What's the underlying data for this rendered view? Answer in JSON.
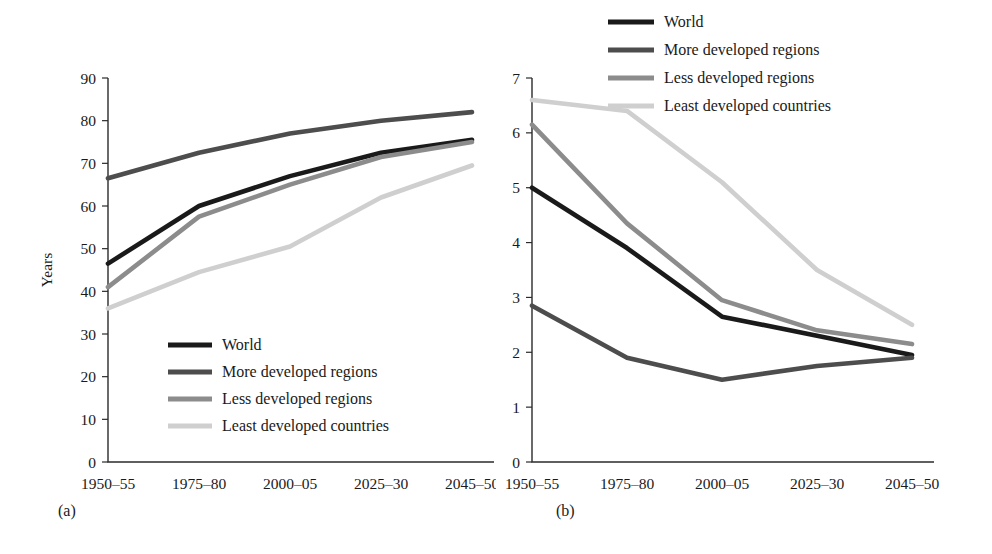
{
  "figure": {
    "background": "#ffffff",
    "panel_labels": {
      "a": "(a)",
      "b": "(b)"
    }
  },
  "palette": {
    "world": "#1a1a1a",
    "more_developed": "#4d4d4d",
    "less_developed": "#8c8c8c",
    "least_developed": "#cfcfcf",
    "axis": "#2b2b2b",
    "text": "#1a1a1a"
  },
  "chart_data": [
    {
      "id": "panel-a",
      "panel_label": "(a)",
      "type": "line",
      "title": "",
      "subtitle": "",
      "xlabel": "",
      "ylabel": "Years",
      "categories": [
        "1950–55",
        "1975–80",
        "2000–05",
        "2025–30",
        "2045–50"
      ],
      "ylim": [
        0,
        90
      ],
      "yticks": [
        0,
        10,
        20,
        30,
        40,
        50,
        60,
        70,
        80,
        90
      ],
      "ytick_labels": [
        "0",
        "10",
        "20",
        "30",
        "40",
        "50",
        "60",
        "70",
        "80",
        "90"
      ],
      "grid": false,
      "legend_position": "inside-bottom-left",
      "series": [
        {
          "name": "World",
          "color": "#1a1a1a",
          "values": [
            46.5,
            60.0,
            67.0,
            72.5,
            75.5
          ]
        },
        {
          "name": "More developed regions",
          "color": "#4d4d4d",
          "values": [
            66.5,
            72.5,
            77.0,
            80.0,
            82.0
          ]
        },
        {
          "name": "Less developed regions",
          "color": "#8c8c8c",
          "values": [
            41.0,
            57.5,
            65.0,
            71.5,
            75.0
          ]
        },
        {
          "name": "Least developed countries",
          "color": "#cfcfcf",
          "values": [
            36.0,
            44.5,
            50.5,
            62.0,
            69.5
          ]
        }
      ]
    },
    {
      "id": "panel-b",
      "panel_label": "(b)",
      "type": "line",
      "title": "",
      "subtitle": "",
      "xlabel": "",
      "ylabel": "Children per woman",
      "categories": [
        "1950–55",
        "1975–80",
        "2000–05",
        "2025–30",
        "2045–50"
      ],
      "ylim": [
        0,
        7
      ],
      "yticks": [
        0,
        1,
        2,
        3,
        4,
        5,
        6,
        7
      ],
      "ytick_labels": [
        "0",
        "1",
        "2",
        "3",
        "4",
        "5",
        "6",
        "7"
      ],
      "grid": false,
      "legend_position": "top-right",
      "series": [
        {
          "name": "World",
          "color": "#1a1a1a",
          "values": [
            5.0,
            3.9,
            2.65,
            2.3,
            1.95
          ]
        },
        {
          "name": "More developed regions",
          "color": "#4d4d4d",
          "values": [
            2.85,
            1.9,
            1.5,
            1.75,
            1.9
          ]
        },
        {
          "name": "Less developed regions",
          "color": "#8c8c8c",
          "values": [
            6.15,
            4.35,
            2.95,
            2.4,
            2.15
          ]
        },
        {
          "name": "Least developed countries",
          "color": "#cfcfcf",
          "values": [
            6.6,
            6.4,
            5.1,
            3.5,
            2.5
          ]
        }
      ]
    }
  ]
}
